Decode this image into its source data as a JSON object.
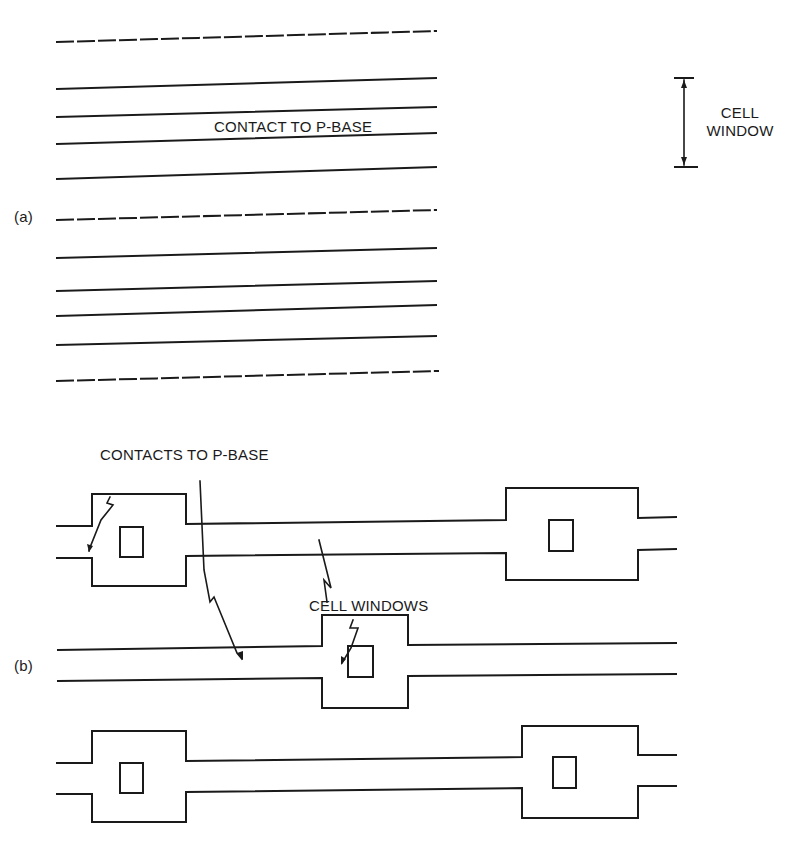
{
  "figure": {
    "ink_color": "#1a1a1a",
    "background": "#ffffff",
    "part_a": {
      "label": "(a)",
      "stripe_label": "CONTACT TO P-BASE",
      "bracket_label_line1": "CELL",
      "bracket_label_line2": "WINDOW",
      "lines": [
        {
          "style": "dashed",
          "y_left": 42,
          "y_right": 31
        },
        {
          "style": "solid",
          "y_left": 89,
          "y_right": 78
        },
        {
          "style": "solid",
          "y_left": 117,
          "y_right": 107
        },
        {
          "style": "solid",
          "y_left": 144,
          "y_right": 133
        },
        {
          "style": "solid",
          "y_left": 179,
          "y_right": 167
        },
        {
          "style": "dashed",
          "y_left": 220,
          "y_right": 210
        },
        {
          "style": "solid",
          "y_left": 258,
          "y_right": 248
        },
        {
          "style": "solid",
          "y_left": 291,
          "y_right": 281
        },
        {
          "style": "solid",
          "y_left": 316,
          "y_right": 305
        },
        {
          "style": "solid",
          "y_left": 345,
          "y_right": 336
        },
        {
          "style": "dashed",
          "y_left": 381,
          "y_right": 371
        }
      ]
    },
    "part_b": {
      "label": "(b)",
      "contacts_label": "CONTACTS TO P-BASE",
      "windows_label": "CELL WINDOWS"
    }
  }
}
